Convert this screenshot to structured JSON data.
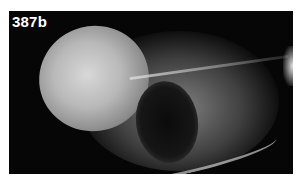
{
  "image": {
    "label": "387b",
    "description": "Grayscale radiograph of a skull in lateral view"
  }
}
